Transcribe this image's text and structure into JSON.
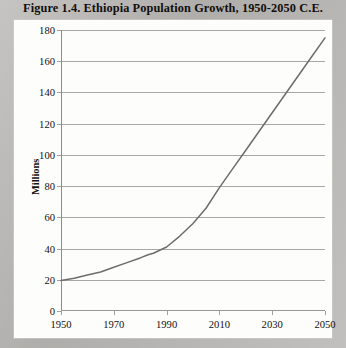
{
  "figure": {
    "title": "Figure 1.4.  Ethiopia Population Growth, 1950-2050 C.E."
  },
  "chart_data": {
    "type": "line",
    "title": "Figure 1.4.  Ethiopia Population Growth, 1950-2050 C.E.",
    "xlabel": "",
    "ylabel": "Millions",
    "xlim": [
      1950,
      2050
    ],
    "ylim": [
      0,
      180
    ],
    "grid": true,
    "legend": false,
    "line_color": "#6f6d6b",
    "xticks": [
      1950,
      1970,
      1990,
      2010,
      2030,
      2050
    ],
    "yticks": [
      0,
      20,
      40,
      60,
      80,
      100,
      120,
      140,
      160,
      180
    ],
    "x": [
      1950,
      1955,
      1960,
      1965,
      1970,
      1975,
      1980,
      1983,
      1985,
      1990,
      1995,
      2000,
      2005,
      2010,
      2015,
      2020,
      2025,
      2030,
      2035,
      2040,
      2045,
      2050
    ],
    "values": [
      19.5,
      21,
      23,
      25,
      28,
      31,
      34,
      36,
      37,
      41,
      48,
      56,
      66,
      79,
      91,
      103,
      115,
      127,
      139,
      151,
      163,
      175
    ],
    "series": [
      {
        "name": "Ethiopia population",
        "values": [
          19.5,
          21,
          23,
          25,
          28,
          31,
          34,
          36,
          37,
          41,
          48,
          56,
          66,
          79,
          91,
          103,
          115,
          127,
          139,
          151,
          163,
          175
        ]
      }
    ]
  }
}
